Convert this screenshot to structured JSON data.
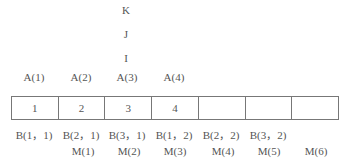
{
  "stack": {
    "letters": [
      "K",
      "J",
      "I"
    ]
  },
  "array_top_labels": [
    "A(1)",
    "A(2)",
    "A(3)",
    "A(4)"
  ],
  "cells": [
    "1",
    "2",
    "3",
    "4",
    "",
    "",
    ""
  ],
  "b_labels": [
    "B(1，1)",
    "B(2，1)",
    "B(3，1)",
    "B(1，2)",
    "B(2，2)",
    "B(3，2)"
  ],
  "m_labels": [
    "M(1)",
    "M(2)",
    "M(3)",
    "M(4)",
    "M(5)",
    "M(6)"
  ]
}
